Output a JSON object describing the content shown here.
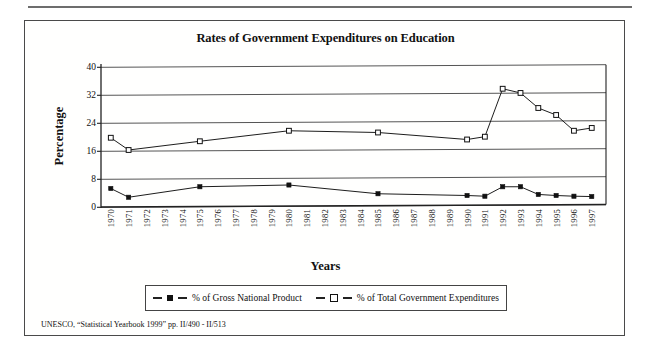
{
  "chart_data": {
    "type": "line",
    "title": "Rates of Government Expenditures on Education",
    "xlabel": "Years",
    "ylabel": "Percentage",
    "ylim": [
      0,
      40
    ],
    "yticks": [
      0,
      8,
      16,
      24,
      32,
      40
    ],
    "grid": true,
    "legend_position": "bottom",
    "categories": [
      "1970",
      "1971",
      "1972",
      "1973",
      "1974",
      "1975",
      "1976",
      "1977",
      "1978",
      "1979",
      "1980",
      "1981",
      "1982",
      "1983",
      "1984",
      "1985",
      "1986",
      "1987",
      "1988",
      "1989",
      "1990",
      "1991",
      "1992",
      "1993",
      "1994",
      "1995",
      "1996",
      "1997"
    ],
    "series": [
      {
        "name": "% of Gross National Product",
        "marker": "filled-square",
        "x": [
          "1970",
          "1971",
          "1975",
          "1980",
          "1985",
          "1990",
          "1991",
          "1992",
          "1993",
          "1994",
          "1995",
          "1996",
          "1997"
        ],
        "values": [
          5.0,
          2.5,
          5.5,
          6.0,
          3.5,
          3.0,
          2.8,
          5.5,
          5.5,
          3.3,
          3.0,
          2.8,
          2.7
        ]
      },
      {
        "name": "% of Total Government Expenditures",
        "marker": "open-square",
        "x": [
          "1970",
          "1971",
          "1975",
          "1980",
          "1985",
          "1990",
          "1991",
          "1992",
          "1993",
          "1994",
          "1995",
          "1996",
          "1997"
        ],
        "values": [
          19.5,
          16.0,
          18.5,
          21.5,
          21.0,
          19.0,
          19.8,
          33.5,
          32.3,
          28.0,
          26.0,
          21.5,
          22.3
        ]
      }
    ]
  },
  "footnote": "UNESCO, “Statistical Yearbook 1999” pp. II/490 - II/513",
  "colors": {
    "frame": "#4a4a4a",
    "axis": "#222222",
    "grid": "#555555",
    "series1": "#111111",
    "series2": "#111111",
    "background": "#ffffff"
  }
}
